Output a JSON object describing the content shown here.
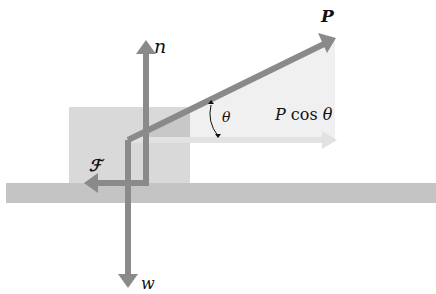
{
  "diagram": {
    "labels": {
      "applied_force": "P",
      "normal_force": "n",
      "friction_force": "ℱ",
      "weight": "w",
      "angle": "θ",
      "horizontal_component_symbol": "P",
      "horizontal_component_rest": " cos ",
      "horizontal_component_angle": "θ"
    },
    "colors": {
      "vector": "#8a8a8a",
      "block": "#d9d9d9",
      "block_overlap": "#c8c8c8",
      "ground": "#c4c4c4",
      "triangle": "#eeeeee",
      "component_arrow": "#e2e2e2",
      "text": "#111111",
      "background": "#ffffff"
    },
    "vectors": [
      {
        "name": "P",
        "from": [
          128,
          140
        ],
        "to": [
          335,
          38
        ]
      },
      {
        "name": "n",
        "from": [
          146,
          185
        ],
        "to": [
          146,
          40
        ]
      },
      {
        "name": "F",
        "from": [
          146,
          183
        ],
        "to": [
          84,
          183
        ]
      },
      {
        "name": "w",
        "from": [
          128,
          140
        ],
        "to": [
          128,
          287
        ]
      },
      {
        "name": "P cos theta",
        "from": [
          128,
          140
        ],
        "to": [
          336,
          140
        ]
      }
    ]
  }
}
